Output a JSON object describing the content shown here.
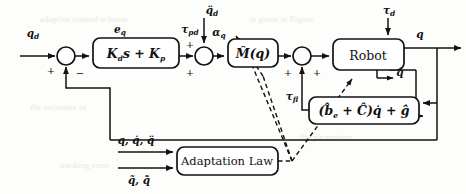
{
  "diagram": {
    "type": "control-block-diagram",
    "canvas": {
      "width": 466,
      "height": 194
    },
    "colors": {
      "line": "#121212",
      "block_fill": "#ffffff",
      "background": "#fdfdfb"
    }
  },
  "blocks": [
    {
      "id": "pd-controller",
      "name": "pd-controller-block",
      "label": "K",
      "label_sub1": "d",
      "label_mid": "s + K",
      "label_sub2": "p",
      "full_label": "K_d s + K_p",
      "x": 93,
      "y": 38,
      "w": 86,
      "h": 30
    },
    {
      "id": "inertia-estimate",
      "name": "inertia-estimate-block",
      "label": "M̂(q)",
      "full_label": "M-hat(q)",
      "x": 228,
      "y": 39,
      "w": 50,
      "h": 28
    },
    {
      "id": "robot",
      "name": "robot-plant-block",
      "label": "Robot",
      "full_label": "Robot",
      "x": 333,
      "y": 39,
      "w": 71,
      "h": 31
    },
    {
      "id": "friction-gravity",
      "name": "friction-gravity-compensation-block",
      "label": "(b̂",
      "label_sub1": "e",
      "label_mid": " + Ĉ)q̇ + ĝ",
      "full_label": "(b_e-hat + C-hat) qdot + g-hat",
      "x": 309,
      "y": 97,
      "w": 110,
      "h": 27
    },
    {
      "id": "adaptation-law",
      "name": "adaptation-law-block",
      "label": "Adaptation Law",
      "full_label": "Adaptation Law",
      "x": 177,
      "y": 147,
      "w": 101,
      "h": 28
    }
  ],
  "summing_junctions": [
    {
      "id": "sum-error",
      "name": "error-summing-junction",
      "cx": 66,
      "cy": 56,
      "r": 9,
      "signs": [
        {
          "text": "+",
          "x": 50,
          "y": 70
        },
        {
          "text": "−",
          "x": 79,
          "y": 74
        }
      ]
    },
    {
      "id": "sum-accel",
      "name": "acceleration-summing-junction",
      "cx": 204,
      "cy": 56,
      "r": 9,
      "signs": [
        {
          "text": "+",
          "x": 189,
          "y": 46
        },
        {
          "text": "+",
          "x": 189,
          "y": 73
        }
      ]
    },
    {
      "id": "sum-torque",
      "name": "torque-summing-junction",
      "cx": 302,
      "cy": 56,
      "r": 9,
      "signs": [
        {
          "text": "+",
          "x": 287,
          "y": 73
        },
        {
          "text": "+",
          "x": 316,
          "y": 73
        }
      ]
    }
  ],
  "signals": [
    {
      "id": "qd",
      "name": "desired-position-signal",
      "label": "q",
      "sub": "d",
      "x": 33,
      "y": 37
    },
    {
      "id": "eq",
      "name": "position-error-signal",
      "label": "e",
      "sub": "q",
      "x": 120,
      "y": 33
    },
    {
      "id": "tau-pd",
      "name": "pd-torque-signal",
      "label": "τ",
      "sub": "pd",
      "x": 191,
      "y": 33
    },
    {
      "id": "qdd-d",
      "name": "desired-acceleration-input",
      "label": "q̈",
      "sub": "d",
      "x": 212,
      "y": 13
    },
    {
      "id": "alpha-q",
      "name": "commanded-acceleration-signal",
      "label": "α",
      "sub": "q",
      "x": 216,
      "y": 36
    },
    {
      "id": "tau-d",
      "name": "disturbance-torque-input",
      "label": "τ",
      "sub": "d",
      "x": 388,
      "y": 13
    },
    {
      "id": "tau-fl",
      "name": "feedback-linearization-torque",
      "label": "τ",
      "sub": "fl",
      "x": 290,
      "y": 99
    },
    {
      "id": "q-out",
      "name": "joint-position-output",
      "label": "q",
      "sub": "",
      "x": 419,
      "y": 37
    },
    {
      "id": "qdot-out",
      "name": "joint-velocity-output",
      "label": "q̇",
      "sub": "",
      "x": 399,
      "y": 75
    }
  ],
  "adaptation_inputs": [
    {
      "id": "adapt-in-top",
      "name": "adaptation-state-input-label",
      "label": "q, q̇, q̈",
      "x": 136,
      "y": 142
    },
    {
      "id": "adapt-in-bottom",
      "name": "adaptation-error-input-label",
      "label": "q̃, q̃̇",
      "x": 139,
      "y": 184
    }
  ],
  "background_text": {
    "note": "faint bleed-through text from reverse page",
    "lines": [
      {
        "text": "adaptive control scheme",
        "x": 40,
        "y": 22
      },
      {
        "text": "is given in Figure",
        "x": 250,
        "y": 22
      },
      {
        "text": "the estimates of",
        "x": 30,
        "y": 110
      },
      {
        "text": "the parameters",
        "x": 300,
        "y": 140
      },
      {
        "text": "tracking error",
        "x": 60,
        "y": 168
      }
    ]
  }
}
